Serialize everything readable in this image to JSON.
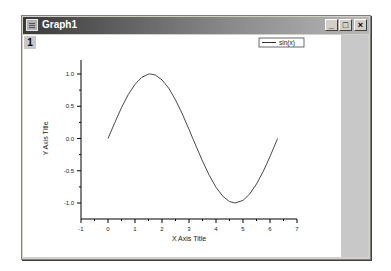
{
  "window": {
    "title": "Graph1",
    "layer_label": "1",
    "controls": {
      "minimize": "_",
      "maximize": "□",
      "close": "×"
    }
  },
  "legend": {
    "entries": [
      {
        "label": "sin(x)",
        "color": "#333333"
      }
    ]
  },
  "colors": {
    "curve": "#333333",
    "axis": "#000000",
    "titlebar_dark": "#3a3a3a",
    "side_panel": "#c8c8c8"
  },
  "chart_data": {
    "type": "line",
    "title": "",
    "xlabel": "X Axis Title",
    "ylabel": "Y Axis Title",
    "xlim": [
      -1,
      7
    ],
    "ylim": [
      -1.25,
      1.25
    ],
    "xticks": [
      "-1",
      "0",
      "1",
      "2",
      "3",
      "4",
      "5",
      "6",
      "7"
    ],
    "yticks": [
      "-1.0",
      "-0.5",
      "0.0",
      "0.5",
      "1.0"
    ],
    "grid": false,
    "legend_position": "top-right",
    "series": [
      {
        "name": "sin(x)",
        "x": [
          0,
          0.25,
          0.5,
          0.75,
          1.0,
          1.25,
          1.5,
          1.571,
          1.75,
          2.0,
          2.25,
          2.5,
          2.75,
          3.0,
          3.14,
          3.25,
          3.5,
          3.75,
          4.0,
          4.25,
          4.5,
          4.712,
          5.0,
          5.25,
          5.5,
          5.75,
          6.0,
          6.28
        ],
        "values": [
          0.0,
          0.247,
          0.479,
          0.682,
          0.841,
          0.949,
          0.997,
          1.0,
          0.984,
          0.909,
          0.778,
          0.598,
          0.382,
          0.141,
          0.0,
          -0.108,
          -0.351,
          -0.572,
          -0.757,
          -0.895,
          -0.978,
          -1.0,
          -0.959,
          -0.859,
          -0.706,
          -0.508,
          -0.279,
          0.0
        ]
      }
    ]
  }
}
